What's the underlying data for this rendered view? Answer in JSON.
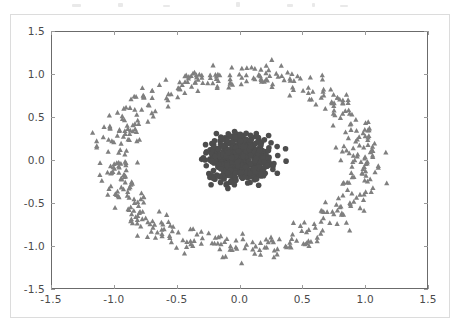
{
  "figure": {
    "background_color": "#ffffff",
    "border_color": "#dcdcdc",
    "axes_edge_color": "#6b6b6b",
    "tick_color": "#9a9a9a",
    "ticklabel_color": "#4a4a4a"
  },
  "chart_data": {
    "type": "scatter",
    "title": "",
    "xlabel": "",
    "ylabel": "",
    "xlim": [
      -1.5,
      1.5
    ],
    "ylim": [
      -1.5,
      1.5
    ],
    "xticks": [
      -1.5,
      -1.0,
      -0.5,
      0.0,
      0.5,
      1.0,
      1.5
    ],
    "yticks": [
      -1.5,
      -1.0,
      -0.5,
      0.0,
      0.5,
      1.0,
      1.5
    ],
    "xticklabels": [
      "-1.5",
      "-1.0",
      "-0.5",
      "0.0",
      "0.5",
      "1.0",
      "1.5"
    ],
    "yticklabels": [
      "-1.5",
      "-1.0",
      "-0.5",
      "0.0",
      "0.5",
      "1.0",
      "1.5"
    ],
    "grid": false,
    "legend": false,
    "legend_position": "none",
    "series": [
      {
        "name": "outer-ring",
        "marker": "triangle-up",
        "color": "#7f7f7f",
        "marker_size": 5.2,
        "n_points": 500,
        "distribution": {
          "shape": "annulus",
          "center": [
            0.0,
            0.0
          ],
          "radius_mean": 1.0,
          "radius_jitter": 0.12,
          "noise_sigma": 0.045
        }
      },
      {
        "name": "inner-blob",
        "marker": "circle",
        "color": "#4d4d4d",
        "marker_size": 5.6,
        "n_points": 500,
        "distribution": {
          "shape": "disc",
          "center": [
            0.0,
            0.0
          ],
          "radius_mean": 0.23,
          "radius_jitter": 0.14,
          "noise_sigma": 0.05
        }
      }
    ]
  },
  "artifacts": {
    "top_strip_blips": [
      {
        "x": 72,
        "y": 4,
        "w": 9,
        "h": 3
      },
      {
        "x": 118,
        "y": 3,
        "w": 5,
        "h": 4
      },
      {
        "x": 163,
        "y": 5,
        "w": 7,
        "h": 2
      },
      {
        "x": 236,
        "y": 2,
        "w": 4,
        "h": 5
      },
      {
        "x": 287,
        "y": 4,
        "w": 6,
        "h": 3
      },
      {
        "x": 312,
        "y": 3,
        "w": 3,
        "h": 4
      },
      {
        "x": 340,
        "y": 5,
        "w": 8,
        "h": 2
      }
    ]
  }
}
